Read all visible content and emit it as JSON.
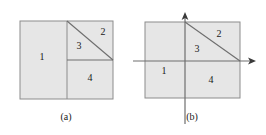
{
  "figure": {
    "background_color": "#ffffff",
    "fill_color": "#e6e6e6",
    "stroke_color": "#8c8c8c",
    "diagonal_color": "#6e6e6e",
    "axis_color": "#6e6e6e",
    "text_color": "#1a1a1a",
    "panels": [
      {
        "id": "panel-a",
        "caption": "(a)",
        "caption_x": 66,
        "caption_y": 118,
        "rect": {
          "x": 20,
          "y": 21,
          "width": 93,
          "height": 78
        },
        "vertical_divider": {
          "x": 67,
          "y1": 21,
          "y2": 99
        },
        "horizontal_divider": {
          "x1": 67,
          "x2": 113,
          "y": 60
        },
        "diagonal": {
          "x1": 67,
          "y1": 21,
          "x2": 113,
          "y2": 60
        },
        "has_axes": false,
        "regions": [
          {
            "label": "1",
            "x": 42,
            "y": 58
          },
          {
            "label": "2",
            "x": 103,
            "y": 33
          },
          {
            "label": "3",
            "x": 79,
            "y": 47
          },
          {
            "label": "4",
            "x": 90,
            "y": 79
          }
        ]
      },
      {
        "id": "panel-b",
        "caption": "(b)",
        "caption_x": 192,
        "caption_y": 118,
        "rect": {
          "x": 145,
          "y": 22,
          "width": 95,
          "height": 76
        },
        "vertical_divider": {
          "x": 185,
          "y1": 22,
          "y2": 98
        },
        "horizontal_divider": {
          "x1": 185,
          "x2": 240,
          "y": 61
        },
        "diagonal": {
          "x1": 185,
          "y1": 22,
          "x2": 240,
          "y2": 61
        },
        "has_axes": true,
        "y_axis": {
          "x": 185,
          "y_top": 12,
          "y_bottom": 124
        },
        "x_axis": {
          "y": 61,
          "x_left": 133,
          "x_right": 256
        },
        "regions": [
          {
            "label": "1",
            "x": 164,
            "y": 72
          },
          {
            "label": "2",
            "x": 219,
            "y": 35
          },
          {
            "label": "3",
            "x": 197,
            "y": 50
          },
          {
            "label": "4",
            "x": 211,
            "y": 81
          }
        ]
      }
    ]
  }
}
